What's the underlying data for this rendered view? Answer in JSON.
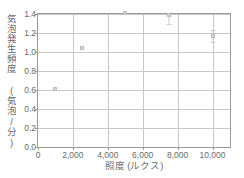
{
  "chart_data": {
    "type": "scatter",
    "title": "",
    "xlabel": "照度 (ルクス)",
    "ylabel": "気泡発生頻度 (気泡/分)",
    "xlim": [
      0,
      11000
    ],
    "ylim": [
      0.0,
      1.4
    ],
    "grid": true,
    "legend": "none",
    "xticks": [
      0,
      2000,
      4000,
      6000,
      8000,
      10000
    ],
    "xtick_labels": [
      "0",
      "2,000",
      "4,000",
      "6,000",
      "8,000",
      "10,000"
    ],
    "yticks": [
      0.0,
      0.2,
      0.4,
      0.6,
      0.8,
      1.0,
      1.2,
      1.4
    ],
    "ytick_labels": [
      "0.0",
      "0.2",
      "0.4",
      "0.6",
      "0.8",
      "1.0",
      "1.2",
      "1.4"
    ],
    "series": [
      {
        "name": "気泡発生頻度",
        "x": [
          1000,
          2500,
          5000,
          7500,
          10000
        ],
        "values": [
          0.61,
          1.04,
          1.41,
          1.39,
          1.17
        ],
        "yerr_low": [
          0.0,
          0.0,
          0.0,
          0.09,
          0.06
        ],
        "yerr_high": [
          0.0,
          0.0,
          0.0,
          0.09,
          0.06
        ]
      }
    ]
  },
  "colors": {
    "frame": "#9a9a9a",
    "grid": "#c8c8c8",
    "marker": "#d3d3d3",
    "errorbar": "#cdcdcd",
    "text": "#6b6b6b",
    "background": "#ffffff"
  }
}
